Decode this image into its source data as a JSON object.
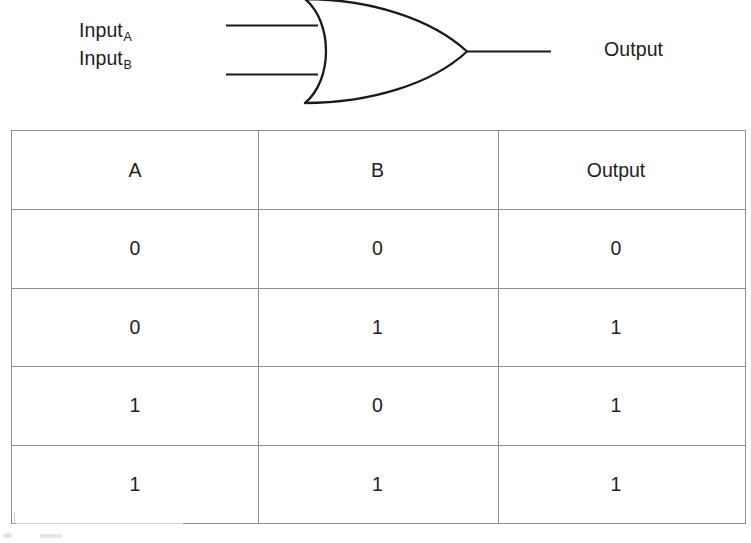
{
  "diagram": {
    "name": "or-gate-symbol",
    "gate_type": "OR",
    "inputs": [
      {
        "label_base": "Input",
        "subscript": "A"
      },
      {
        "label_base": "Input",
        "subscript": "B"
      }
    ],
    "output_label": "Output",
    "stroke_color": "#1a1a1a"
  },
  "table": {
    "headers": [
      "A",
      "B",
      "Output"
    ],
    "rows": [
      [
        "0",
        "0",
        "0"
      ],
      [
        "0",
        "1",
        "1"
      ],
      [
        "1",
        "0",
        "1"
      ],
      [
        "1",
        "1",
        "1"
      ]
    ],
    "border_color": "#8e8e8e"
  }
}
